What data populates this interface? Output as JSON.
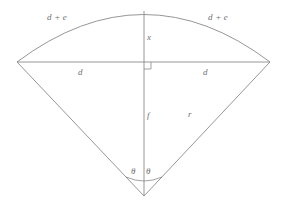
{
  "figure": {
    "background_color": "#ffffff",
    "line_color": "#8a8a8a",
    "label_color": "#6f6f6f"
  },
  "labels": {
    "arc_left": "d + e",
    "arc_right": "d + e",
    "sagitta": "x",
    "half_chord_left": "d",
    "half_chord_right": "d",
    "apothem": "f",
    "radius": "r",
    "angle_left": "θ",
    "angle_right": "θ"
  },
  "geometry": {
    "apex": {
      "x": 144,
      "y": 196
    },
    "chord_left": {
      "x": 17,
      "y": 62
    },
    "chord_right": {
      "x": 270,
      "y": 62
    },
    "arc_top": {
      "x": 144,
      "y": 11
    },
    "axis_top": {
      "x": 144,
      "y": 11
    },
    "axis_bottom": {
      "x": 144,
      "y": 196
    },
    "right_angle_marker": {
      "x": 144,
      "y": 62,
      "size": 7
    },
    "angle_arc_radius": 26
  }
}
